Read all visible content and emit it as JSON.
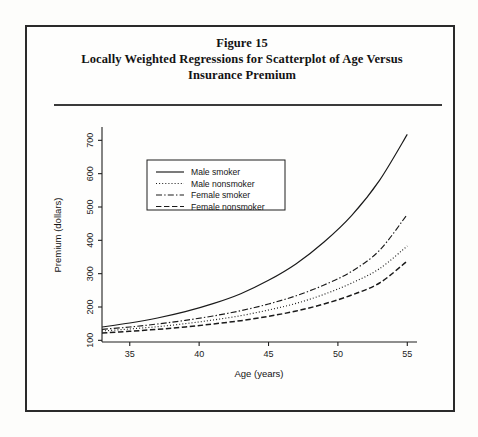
{
  "figure": {
    "title_line1": "Figure 15",
    "title_line2": "Locally Weighted Regressions for Scatterplot of Age Versus",
    "title_line3": "Insurance Premium"
  },
  "chart_data": {
    "type": "line",
    "title": "Locally Weighted Regressions for Scatterplot of Age Versus Insurance Premium",
    "xlabel": "Age (years)",
    "ylabel": "Premium (dollars)",
    "xlim": [
      33,
      55.7
    ],
    "ylim": [
      95,
      740
    ],
    "xticks": [
      35,
      40,
      45,
      50,
      55
    ],
    "yticks": [
      100,
      200,
      300,
      400,
      500,
      600,
      700
    ],
    "xtick_labels": [
      "35",
      "40",
      "45",
      "50",
      "55"
    ],
    "ytick_labels": [
      "100",
      "200",
      "300",
      "400",
      "500",
      "600",
      "700"
    ],
    "grid": false,
    "legend_position": "upper left",
    "x": [
      33,
      35,
      37,
      39,
      41,
      43,
      45,
      47,
      49,
      51,
      53,
      55
    ],
    "series": [
      {
        "name": "Male smoker",
        "style": "solid",
        "values": [
          140,
          152,
          167,
          186,
          210,
          240,
          280,
          330,
          395,
          475,
          580,
          718
        ]
      },
      {
        "name": "Male nonsmoker",
        "style": "dotted",
        "values": [
          128,
          134,
          141,
          150,
          161,
          174,
          191,
          211,
          238,
          272,
          315,
          383
        ]
      },
      {
        "name": "Female smoker",
        "style": "dash-dot",
        "values": [
          133,
          140,
          149,
          160,
          173,
          189,
          209,
          234,
          266,
          307,
          370,
          478
        ]
      },
      {
        "name": "Female nonsmoker",
        "style": "dashed",
        "values": [
          122,
          127,
          133,
          140,
          149,
          159,
          172,
          188,
          209,
          236,
          272,
          338
        ]
      }
    ]
  },
  "legend": {
    "items": [
      {
        "label": "Male smoker",
        "style": "solid"
      },
      {
        "label": "Male nonsmoker",
        "style": "dotted"
      },
      {
        "label": "Female smoker",
        "style": "dash-dot"
      },
      {
        "label": "Female nonsmoker",
        "style": "dashed"
      }
    ]
  }
}
